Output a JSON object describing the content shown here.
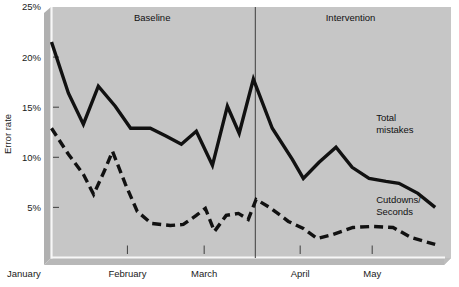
{
  "chart_data": {
    "type": "line",
    "title": "",
    "subtitle": "",
    "xlabel": "",
    "ylabel": "Error rate",
    "ylim": [
      0,
      25
    ],
    "xlim": [
      0,
      100
    ],
    "grid": false,
    "legend_position": "inline-right",
    "y_ticks": [
      {
        "value": 25,
        "label": "25%"
      },
      {
        "value": 20,
        "label": "20%"
      },
      {
        "value": 15,
        "label": "15%"
      },
      {
        "value": 10,
        "label": "10%"
      },
      {
        "value": 5,
        "label": "5%"
      }
    ],
    "x_ticks": [
      {
        "pos": 4.8,
        "label": "January"
      },
      {
        "pos": 19.3,
        "label": "February"
      },
      {
        "pos": 38.8,
        "label": "March"
      },
      {
        "pos": 63.2,
        "label": "April"
      },
      {
        "pos": 81.5,
        "label": "May"
      }
    ],
    "phases": [
      {
        "name": "Baseline",
        "label": "Baseline",
        "center_pos": 25.6
      },
      {
        "name": "Intervention",
        "label": "Intervention",
        "center_pos": 76.0
      }
    ],
    "phase_divider_pos": 51.8,
    "series": [
      {
        "name": "Total mistakes",
        "label": "Total mistakes",
        "style": "solid",
        "color": "#111111",
        "label_pos": {
          "x": 82.5,
          "y": 13.6
        },
        "points": [
          {
            "x": 0.0,
            "y": 21.5
          },
          {
            "x": 4.3,
            "y": 16.4
          },
          {
            "x": 8.1,
            "y": 13.3
          },
          {
            "x": 11.9,
            "y": 17.1
          },
          {
            "x": 16.2,
            "y": 15.1
          },
          {
            "x": 20.1,
            "y": 12.9
          },
          {
            "x": 25.1,
            "y": 12.9
          },
          {
            "x": 29.2,
            "y": 12.1
          },
          {
            "x": 33.0,
            "y": 11.3
          },
          {
            "x": 36.8,
            "y": 12.6
          },
          {
            "x": 40.9,
            "y": 9.2
          },
          {
            "x": 44.7,
            "y": 15.1
          },
          {
            "x": 47.7,
            "y": 12.4
          },
          {
            "x": 51.3,
            "y": 17.8
          },
          {
            "x": 56.1,
            "y": 12.9
          },
          {
            "x": 61.2,
            "y": 9.8
          },
          {
            "x": 64.0,
            "y": 7.9
          },
          {
            "x": 68.0,
            "y": 9.5
          },
          {
            "x": 72.3,
            "y": 11.0
          },
          {
            "x": 76.4,
            "y": 9.0
          },
          {
            "x": 80.7,
            "y": 7.9
          },
          {
            "x": 85.0,
            "y": 7.6
          },
          {
            "x": 88.3,
            "y": 7.4
          },
          {
            "x": 93.1,
            "y": 6.4
          },
          {
            "x": 97.5,
            "y": 5.0
          }
        ]
      },
      {
        "name": "Cutdowns/Seconds",
        "label": "Cutdowns/\nSeconds",
        "label_line1": "Cutdowns/",
        "label_line2": "Seconds",
        "style": "dashed",
        "color": "#111111",
        "label_pos": {
          "x": 82.5,
          "y": 5.4
        },
        "points": [
          {
            "x": 0.0,
            "y": 12.9
          },
          {
            "x": 4.3,
            "y": 10.3
          },
          {
            "x": 8.1,
            "y": 8.3
          },
          {
            "x": 10.7,
            "y": 6.3
          },
          {
            "x": 13.4,
            "y": 8.6
          },
          {
            "x": 15.5,
            "y": 10.6
          },
          {
            "x": 18.8,
            "y": 7.3
          },
          {
            "x": 21.8,
            "y": 4.6
          },
          {
            "x": 25.4,
            "y": 3.4
          },
          {
            "x": 30.2,
            "y": 3.2
          },
          {
            "x": 33.5,
            "y": 3.3
          },
          {
            "x": 36.8,
            "y": 4.2
          },
          {
            "x": 39.1,
            "y": 4.9
          },
          {
            "x": 41.4,
            "y": 2.6
          },
          {
            "x": 44.4,
            "y": 4.2
          },
          {
            "x": 47.5,
            "y": 4.4
          },
          {
            "x": 50.0,
            "y": 3.8
          },
          {
            "x": 52.0,
            "y": 5.8
          },
          {
            "x": 55.8,
            "y": 4.9
          },
          {
            "x": 60.2,
            "y": 3.6
          },
          {
            "x": 64.0,
            "y": 2.9
          },
          {
            "x": 67.5,
            "y": 1.9
          },
          {
            "x": 71.5,
            "y": 2.3
          },
          {
            "x": 76.6,
            "y": 3.0
          },
          {
            "x": 81.5,
            "y": 3.1
          },
          {
            "x": 86.8,
            "y": 3.0
          },
          {
            "x": 91.4,
            "y": 2.0
          },
          {
            "x": 97.5,
            "y": 1.3
          }
        ]
      }
    ],
    "colors": {
      "plot_background": "#c6c6c6",
      "shadow_background": "#b4b4b4",
      "axis_line": "#ffffff",
      "line_color": "#111111",
      "divider_color": "#3a3a3a",
      "text_color": "#111111",
      "page_background": "#ffffff"
    }
  }
}
